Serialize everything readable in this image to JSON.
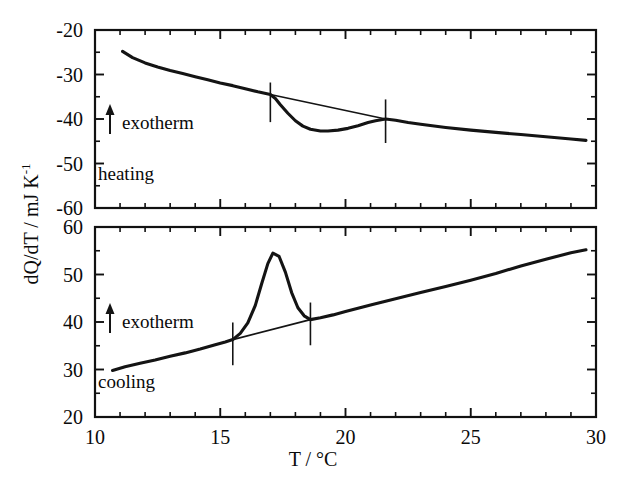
{
  "figure": {
    "name": "dsc-thermogram",
    "background": "#ffffff",
    "ink_color": "#141414",
    "xlabel": "T / °C",
    "ylabel_main": "dQ/dT / mJ K",
    "ylabel_exponent": "-1"
  },
  "axis": {
    "x_ticks": [
      "10",
      "15",
      "20",
      "25",
      "30"
    ],
    "x_tick_values": [
      10,
      15,
      20,
      25,
      30
    ],
    "x_minor_step": 1,
    "x_range": [
      10,
      30
    ],
    "upper_y_ticks": [
      "-20",
      "-30",
      "-40",
      "-50",
      "-60"
    ],
    "upper_y_tick_values": [
      -20,
      -30,
      -40,
      -50,
      -60
    ],
    "upper_y_range": [
      -60,
      -20
    ],
    "lower_y_ticks": [
      "60",
      "50",
      "40",
      "30",
      "20"
    ],
    "lower_y_tick_values": [
      60,
      50,
      40,
      30,
      20
    ],
    "lower_y_range": [
      20,
      60
    ],
    "y_minor_step": 5
  },
  "annotations": {
    "upper_exotherm": "exotherm",
    "upper_mode": "heating",
    "lower_exotherm": "exotherm",
    "lower_mode": "cooling",
    "arrow_direction": "up"
  },
  "chart_data": [
    {
      "type": "line",
      "title": "heating",
      "panel": "upper",
      "xlabel": "T / °C",
      "ylabel": "dQ/dT / mJ K^-1",
      "xlim": [
        10,
        30
      ],
      "ylim": [
        -60,
        -20
      ],
      "grid": false,
      "legend": "none",
      "exotherm_direction": "up",
      "series": [
        {
          "name": "heating scan",
          "x": [
            11.1,
            11.5,
            12.0,
            12.5,
            13.0,
            13.5,
            14.0,
            14.5,
            15.0,
            15.5,
            16.0,
            16.5,
            17.0,
            17.2,
            17.4,
            17.7,
            18.0,
            18.3,
            18.6,
            19.0,
            19.3,
            19.7,
            20.1,
            20.5,
            20.9,
            21.2,
            21.6,
            22.0,
            22.5,
            23.0,
            24.0,
            25.0,
            26.0,
            27.0,
            28.0,
            29.0,
            29.6
          ],
          "y": [
            -24.8,
            -26.2,
            -27.4,
            -28.3,
            -29.1,
            -29.8,
            -30.5,
            -31.2,
            -31.9,
            -32.5,
            -33.2,
            -33.9,
            -34.5,
            -35.4,
            -36.8,
            -38.7,
            -40.4,
            -41.6,
            -42.3,
            -42.7,
            -42.7,
            -42.5,
            -42.1,
            -41.5,
            -40.8,
            -40.4,
            -40.0,
            -40.3,
            -40.8,
            -41.2,
            -41.9,
            -42.5,
            -43.0,
            -43.5,
            -44.0,
            -44.5,
            -44.8
          ]
        }
      ],
      "baseline": {
        "name": "baseline tangent",
        "x": [
          17.0,
          21.6
        ],
        "y": [
          -34.5,
          -40.0
        ]
      },
      "markers": [
        {
          "name": "onset marker",
          "x": 17.0,
          "y_top": -31.8,
          "y_bottom": -40.7
        },
        {
          "name": "offset marker",
          "x": 21.6,
          "y_top": -35.6,
          "y_bottom": -45.4
        }
      ],
      "peak": {
        "name": "endothermic dip",
        "x": 19.2,
        "y": -42.7
      }
    },
    {
      "type": "line",
      "title": "cooling",
      "panel": "lower",
      "xlabel": "T / °C",
      "ylabel": "dQ/dT / mJ K^-1",
      "xlim": [
        10,
        30
      ],
      "ylim": [
        20,
        60
      ],
      "grid": false,
      "legend": "none",
      "exotherm_direction": "up",
      "series": [
        {
          "name": "cooling scan",
          "x": [
            10.7,
            11.2,
            11.8,
            12.4,
            13.0,
            13.6,
            14.2,
            14.8,
            15.2,
            15.5,
            15.8,
            16.1,
            16.4,
            16.65,
            16.9,
            17.1,
            17.35,
            17.6,
            17.85,
            18.1,
            18.35,
            18.6,
            19.0,
            19.5,
            20.0,
            21.0,
            22.0,
            23.0,
            24.0,
            25.0,
            26.0,
            27.0,
            28.0,
            29.0,
            29.6
          ],
          "y": [
            29.8,
            30.6,
            31.3,
            32.0,
            32.8,
            33.5,
            34.3,
            35.2,
            35.8,
            36.3,
            37.6,
            39.8,
            43.5,
            48.0,
            52.3,
            54.5,
            53.8,
            50.5,
            46.2,
            43.0,
            41.3,
            40.5,
            40.9,
            41.5,
            42.2,
            43.6,
            44.9,
            46.2,
            47.5,
            48.8,
            50.2,
            51.8,
            53.2,
            54.6,
            55.2
          ]
        }
      ],
      "baseline": {
        "name": "baseline tangent",
        "x": [
          15.5,
          18.6
        ],
        "y": [
          36.3,
          40.5
        ]
      },
      "markers": [
        {
          "name": "onset marker",
          "x": 15.5,
          "y_top": 39.9,
          "y_bottom": 30.9
        },
        {
          "name": "offset marker",
          "x": 18.6,
          "y_top": 44.1,
          "y_bottom": 35.1
        }
      ],
      "peak": {
        "name": "exothermic peak",
        "x": 17.1,
        "y": 54.5
      }
    }
  ]
}
